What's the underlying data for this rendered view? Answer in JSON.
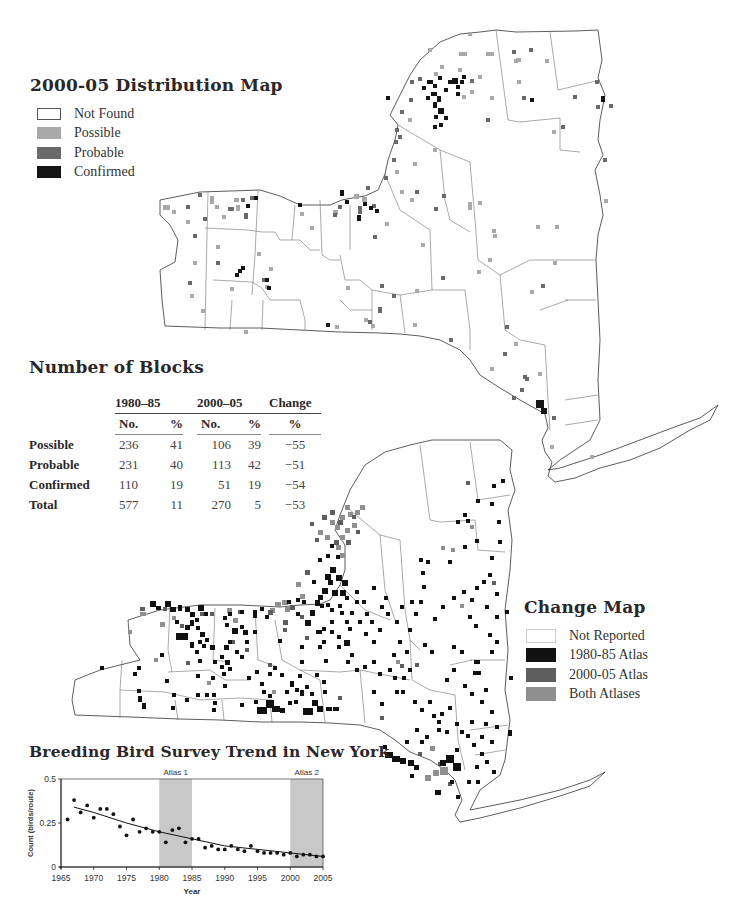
{
  "distribution_map": {
    "title": "2000-05 Distribution Map",
    "legend": [
      {
        "label": "Not Found",
        "color": "#ffffff"
      },
      {
        "label": "Possible",
        "color": "#a9a9a9"
      },
      {
        "label": "Probable",
        "color": "#6a6a6a"
      },
      {
        "label": "Confirmed",
        "color": "#111111"
      }
    ]
  },
  "blocks_table": {
    "title": "Number of Blocks",
    "group_headers": [
      "1980–85",
      "2000–05",
      "Change"
    ],
    "sub_headers": [
      "No.",
      "%",
      "No.",
      "%",
      "%"
    ],
    "rows": [
      {
        "label": "Possible",
        "no1": "236",
        "pct1": "41",
        "no2": "106",
        "pct2": "39",
        "change": "−55"
      },
      {
        "label": "Probable",
        "no1": "231",
        "pct1": "40",
        "no2": "113",
        "pct2": "42",
        "change": "−51"
      },
      {
        "label": "Confirmed",
        "no1": "110",
        "pct1": "19",
        "no2": "51",
        "pct2": "19",
        "change": "−54"
      },
      {
        "label": "Total",
        "no1": "577",
        "pct1": "11",
        "no2": "270",
        "pct2": "5",
        "change": "−53"
      }
    ]
  },
  "change_map": {
    "title": "Change Map",
    "legend": [
      {
        "label": "Not Reported",
        "color": "#ffffff"
      },
      {
        "label": "1980-85 Atlas",
        "color": "#111111"
      },
      {
        "label": "2000-05 Atlas",
        "color": "#5e5e5e"
      },
      {
        "label": "Both Atlases",
        "color": "#8f8f8f"
      }
    ]
  },
  "chart_data": {
    "type": "scatter",
    "title": "Breeding Bird Survey Trend in New York",
    "xlabel": "Year",
    "ylabel": "Count (birds/route)",
    "xlim": [
      1965,
      2005
    ],
    "ylim": [
      0,
      0.5
    ],
    "x_ticks": [
      "1965",
      "1970",
      "1975",
      "1980",
      "1985",
      "1990",
      "1995",
      "2000",
      "2005"
    ],
    "y_ticks": [
      "0",
      "0.25",
      "0.5"
    ],
    "grid": false,
    "annotations": [
      {
        "label": "Atlas 1",
        "x_start": 1980,
        "x_end": 1985,
        "shade": "#c8c8c8"
      },
      {
        "label": "Atlas 2",
        "x_start": 2000,
        "x_end": 2005,
        "shade": "#c8c8c8"
      }
    ],
    "series": [
      {
        "name": "Annual index",
        "x": [
          1966,
          1967,
          1968,
          1969,
          1970,
          1971,
          1972,
          1973,
          1974,
          1975,
          1976,
          1977,
          1978,
          1979,
          1980,
          1981,
          1982,
          1983,
          1984,
          1985,
          1986,
          1987,
          1988,
          1989,
          1990,
          1991,
          1992,
          1993,
          1994,
          1995,
          1996,
          1997,
          1998,
          1999,
          2000,
          2001,
          2002,
          2003,
          2004,
          2005
        ],
        "values": [
          0.27,
          0.38,
          0.31,
          0.35,
          0.28,
          0.33,
          0.33,
          0.3,
          0.23,
          0.18,
          0.27,
          0.2,
          0.22,
          0.2,
          0.2,
          0.14,
          0.21,
          0.22,
          0.14,
          0.16,
          0.16,
          0.11,
          0.12,
          0.1,
          0.1,
          0.12,
          0.1,
          0.09,
          0.12,
          0.09,
          0.08,
          0.08,
          0.08,
          0.07,
          0.08,
          0.06,
          0.07,
          0.07,
          0.06,
          0.06
        ]
      },
      {
        "name": "Trend line",
        "x": [
          1967,
          1970,
          1975,
          1980,
          1985,
          1990,
          1995,
          2000,
          2005
        ],
        "values": [
          0.34,
          0.31,
          0.25,
          0.2,
          0.16,
          0.12,
          0.1,
          0.08,
          0.06
        ]
      }
    ]
  }
}
